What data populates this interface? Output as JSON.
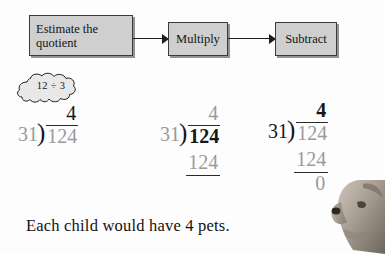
{
  "flowchart": {
    "steps": [
      {
        "id": "estimate",
        "label": "Estimate the\nquotient"
      },
      {
        "id": "multiply",
        "label": "Multiply"
      },
      {
        "id": "subtract",
        "label": "Subtract"
      }
    ],
    "box_fill_color": "#cfcfcf",
    "box_border_color": "#3b3b3b",
    "arrow_color": "#1d1d1d"
  },
  "thought_bubble": {
    "text": "12 ÷ 3"
  },
  "problems": [
    {
      "id": "problem-estimate",
      "quotient": "4",
      "divisor": "31",
      "bracket": ")",
      "dividend": "124",
      "product": "",
      "remainder": ""
    },
    {
      "id": "problem-multiply",
      "quotient": "4",
      "divisor": "31",
      "bracket": ")",
      "dividend": "124",
      "product": "124",
      "remainder": ""
    },
    {
      "id": "problem-subtract",
      "quotient": "4",
      "divisor": "31",
      "bracket": ")",
      "dividend": "124",
      "product": "124",
      "remainder": "0"
    }
  ],
  "caption": {
    "text": "Each child would have 4 pets."
  },
  "illustration": {
    "subject": "dog-photo"
  },
  "colors": {
    "gray_digit": "#9a9a9a",
    "dark_digit": "#161616",
    "rule": "#2a2a2a",
    "page_background": "#fdfdfd"
  }
}
